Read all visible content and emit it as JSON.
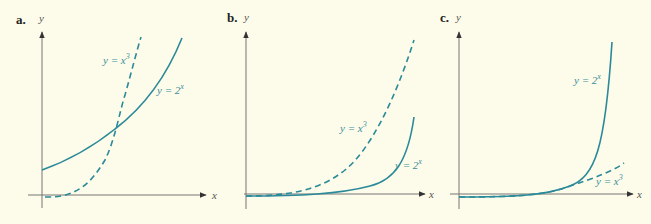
{
  "colors": {
    "background": "#fdfbe9",
    "curve": "#2a8a99",
    "axis": "#555555",
    "panel_label": "#222222"
  },
  "panels": [
    {
      "label": "a.",
      "x_axis": "x",
      "y_axis": "y",
      "curves": [
        {
          "name": "y = 2^x",
          "text": "y = 2",
          "sup": "x",
          "style": "solid"
        },
        {
          "name": "y = x^3",
          "text": "y = x",
          "sup": "3",
          "style": "dashed"
        }
      ]
    },
    {
      "label": "b.",
      "x_axis": "x",
      "y_axis": "y",
      "curves": [
        {
          "name": "y = x^3",
          "text": "y = x",
          "sup": "3",
          "style": "dashed"
        },
        {
          "name": "y = 2^x",
          "text": "y = 2",
          "sup": "x",
          "style": "solid"
        }
      ]
    },
    {
      "label": "c.",
      "x_axis": "x",
      "y_axis": "y",
      "curves": [
        {
          "name": "y = 2^x",
          "text": "y = 2",
          "sup": "x",
          "style": "solid"
        },
        {
          "name": "y = x^3",
          "text": "y = x",
          "sup": "3",
          "style": "dashed"
        }
      ]
    }
  ]
}
